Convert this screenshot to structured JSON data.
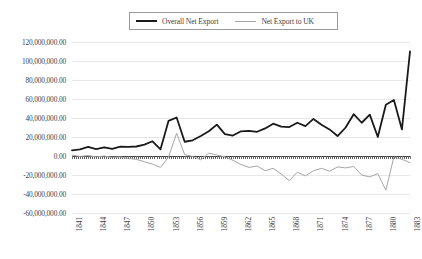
{
  "chart_data": {
    "type": "line",
    "title": "",
    "xlabel": "",
    "ylabel": "",
    "xlim": [
      1841,
      1883
    ],
    "ylim": [
      -60000000,
      120000000
    ],
    "grid": true,
    "legend_position": "top-center",
    "ytick_labels": [
      "120,000,000.00",
      "100,000,000.00",
      "80,000,000.00",
      "60,000,000.00",
      "40,000,000.00",
      "20,000,000.00",
      "0.00",
      "-20,000,000.00",
      "-40,000,000.00",
      "-60,000,000.00"
    ],
    "ytick_values": [
      120000000,
      100000000,
      80000000,
      60000000,
      40000000,
      20000000,
      0,
      -20000000,
      -40000000,
      -60000000
    ],
    "xtick_labels": [
      "1841",
      "1844",
      "1847",
      "1850",
      "1853",
      "1856",
      "1859",
      "1862",
      "1865",
      "1868",
      "1871",
      "1874",
      "1877",
      "1880",
      "1883"
    ],
    "x": [
      1841,
      1842,
      1843,
      1844,
      1845,
      1846,
      1847,
      1848,
      1849,
      1850,
      1851,
      1852,
      1853,
      1854,
      1855,
      1856,
      1857,
      1858,
      1859,
      1860,
      1861,
      1862,
      1863,
      1864,
      1865,
      1866,
      1867,
      1868,
      1869,
      1870,
      1871,
      1872,
      1873,
      1874,
      1875,
      1876,
      1877,
      1878,
      1879,
      1880,
      1881,
      1882,
      1883
    ],
    "series": [
      {
        "name": "Overall Net Export",
        "color": "#1a1a1a",
        "width": 1.8,
        "values": [
          6000000,
          7000000,
          9500000,
          7200000,
          9200000,
          7400000,
          9800000,
          9600000,
          10000000,
          12000000,
          15500000,
          7000000,
          37000000,
          40500000,
          15000000,
          16500000,
          21000000,
          26000000,
          33000000,
          23000000,
          21500000,
          26000000,
          26500000,
          25500000,
          29000000,
          34000000,
          31000000,
          30500000,
          35000000,
          31500000,
          39000000,
          33000000,
          28000000,
          21000000,
          30000000,
          44000000,
          35000000,
          43500000,
          20000000,
          54000000,
          59000000,
          28000000,
          110000000
        ]
      },
      {
        "name": "Net Export to UK",
        "color": "#a6a6a6",
        "width": 1.0,
        "values": [
          1000000,
          -500000,
          500000,
          -1000000,
          0,
          -1500000,
          -1000000,
          -2500000,
          -3500000,
          -6000000,
          -8500000,
          -12000000,
          -1000000,
          24000000,
          1500000,
          -500000,
          -4000000,
          3000000,
          1000000,
          -1000000,
          -4500000,
          -9000000,
          -12000000,
          -10500000,
          -15500000,
          -13000000,
          -19000000,
          -26000000,
          -17000000,
          -21000000,
          -15500000,
          -13000000,
          -16000000,
          -11500000,
          -12500000,
          -11000000,
          -20000000,
          -22000000,
          -18500000,
          -36000000,
          -1000000,
          -3500000,
          -7000000
        ]
      }
    ]
  },
  "legend": {
    "entries": [
      {
        "label": "Overall Net Export",
        "marker": "thick-line-swatch"
      },
      {
        "label": "Net Export to UK",
        "marker": "thin-line-swatch"
      }
    ]
  },
  "colors": {
    "overall_net_export": "#1a1a1a",
    "net_export_uk": "#a6a6a6",
    "gridline": "#e8e8e8",
    "axis": "#3a3a3a",
    "text": "#3f3f3f",
    "background": "#ffffff"
  }
}
